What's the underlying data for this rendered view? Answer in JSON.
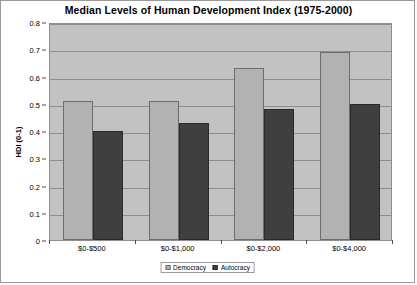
{
  "chart_data": {
    "type": "bar",
    "title": "Median Levels of Human Development Index (1975-2000)",
    "xlabel": "",
    "ylabel": "HDI (0-1)",
    "categories": [
      "$0-$500",
      "$0-$1,000",
      "$0-$2,000",
      "$0-$4,000"
    ],
    "series": [
      {
        "name": "Democracy",
        "color": "#b2b2b2",
        "values": [
          0.51,
          0.51,
          0.63,
          0.69
        ]
      },
      {
        "name": "Autocracy",
        "color": "#3f3f3f",
        "values": [
          0.4,
          0.43,
          0.48,
          0.5
        ]
      }
    ],
    "ylim": [
      0,
      0.8
    ],
    "y_ticks": [
      "0",
      "0.1",
      "0.2",
      "0.3",
      "0.4",
      "0.5",
      "0.6",
      "0.7",
      "0.8"
    ],
    "grid": true,
    "legend_position": "bottom",
    "plot_background": "#c2c2c2",
    "gridline_color": "#8e8e8e"
  }
}
